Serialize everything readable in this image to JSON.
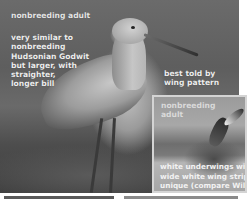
{
  "main_photo": {
    "subject": "godwit-nonbreeding-adult",
    "title": "nonbreeding adult",
    "description_lines": [
      "very similar to",
      "nonbreeding",
      "Hudsonian Godwit",
      "but larger, with",
      "straighter,",
      "longer bill"
    ],
    "wing_note_lines": [
      "best told by",
      "wing pattern"
    ]
  },
  "inset_photo": {
    "title_lines": [
      "nonbreeding",
      "adult"
    ],
    "description_lines": [
      "white underwings with",
      "wide white wing stripe",
      "unique (compare Willet"
    ]
  }
}
